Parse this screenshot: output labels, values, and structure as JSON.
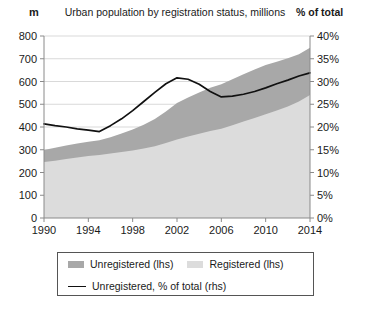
{
  "header": {
    "left_unit": "m",
    "title": "Urban population by registration status, millions",
    "right_unit": "% of total"
  },
  "legend": {
    "unregistered_label": "Unregistered (lhs)",
    "registered_label": "Registered (lhs)",
    "line_label": "Unregistered, % of total (rhs)"
  },
  "colors": {
    "unregistered": "#a8a8a8",
    "registered": "#dcdcdc",
    "line": "#111111",
    "axis": "#8a8a8a",
    "gridline": "#d9d9d9",
    "text": "#1a1a1a"
  },
  "chart_data": {
    "type": "area",
    "title": "Urban population by registration status, millions",
    "xlabel": "",
    "ylabel": "m",
    "ylabel_right": "% of total",
    "xlim": [
      1990,
      2014
    ],
    "ylim": [
      0,
      800
    ],
    "ylim_right": [
      0,
      40
    ],
    "grid": true,
    "legend_position": "bottom",
    "x": [
      1990,
      1991,
      1992,
      1993,
      1994,
      1995,
      1996,
      1997,
      1998,
      1999,
      2000,
      2001,
      2002,
      2003,
      2004,
      2005,
      2006,
      2007,
      2008,
      2009,
      2010,
      2011,
      2012,
      2013,
      2014
    ],
    "xticks": [
      1990,
      1994,
      1998,
      2002,
      2006,
      2010,
      2014
    ],
    "yticks": [
      0,
      100,
      200,
      300,
      400,
      500,
      600,
      700,
      800
    ],
    "yticks_right": [
      "0%",
      "5%",
      "10%",
      "15%",
      "20%",
      "25%",
      "30%",
      "35%",
      "40%"
    ],
    "series": [
      {
        "name": "Registered (lhs)",
        "axis": "left",
        "stacked": true,
        "color": "#dcdcdc",
        "values": [
          246,
          252,
          259,
          266,
          272,
          277,
          283,
          290,
          297,
          305,
          315,
          330,
          345,
          358,
          370,
          382,
          392,
          408,
          424,
          440,
          456,
          472,
          490,
          512,
          541
        ]
      },
      {
        "name": "Unregistered (lhs)",
        "axis": "left",
        "stacked": true,
        "color": "#a8a8a8",
        "values": [
          53,
          57,
          60,
          62,
          63,
          65,
          72,
          81,
          92,
          105,
          120,
          138,
          160,
          172,
          182,
          190,
          196,
          202,
          208,
          213,
          216,
          215,
          212,
          208,
          207
        ]
      },
      {
        "name": "Unregistered, % of total (rhs)",
        "axis": "right",
        "type": "line",
        "color": "#111111",
        "values": [
          20.7,
          20.3,
          20.0,
          19.6,
          19.3,
          19.0,
          20.3,
          21.8,
          23.6,
          25.6,
          27.6,
          29.5,
          30.8,
          30.5,
          29.4,
          27.8,
          26.6,
          26.8,
          27.2,
          27.8,
          28.6,
          29.5,
          30.3,
          31.2,
          31.9
        ]
      }
    ]
  }
}
